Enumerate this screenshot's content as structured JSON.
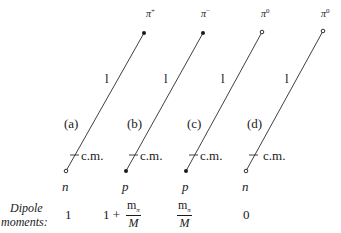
{
  "diagrams": [
    {
      "label": "(a)",
      "nucleon": "n",
      "pion": "π",
      "pion_charge": "+",
      "length_label": "l",
      "cm_label": "c.m.",
      "nucleon_dot": "open",
      "pion_dot": "filled",
      "dipole": "1"
    },
    {
      "label": "(b)",
      "nucleon": "p",
      "pion": "π",
      "pion_charge": "−",
      "length_label": "l",
      "cm_label": "c.m.",
      "nucleon_dot": "filled",
      "pion_dot": "filled",
      "dipole_prefix": "1 +",
      "dipole_num": "m",
      "dipole_num_sub": "π",
      "dipole_den": "M"
    },
    {
      "label": "(c)",
      "nucleon": "p",
      "pion": "π",
      "pion_charge": "0",
      "length_label": "l",
      "cm_label": "c.m.",
      "nucleon_dot": "filled",
      "pion_dot": "open",
      "dipole_num": "m",
      "dipole_num_sub": "π",
      "dipole_den": "M"
    },
    {
      "label": "(d)",
      "nucleon": "n",
      "pion": "π",
      "pion_charge": "0",
      "length_label": "l",
      "cm_label": "c.m.",
      "nucleon_dot": "open",
      "pion_dot": "open",
      "dipole": "0"
    }
  ],
  "dipole_heading_line1": "Dipole",
  "dipole_heading_line2": "moments:"
}
